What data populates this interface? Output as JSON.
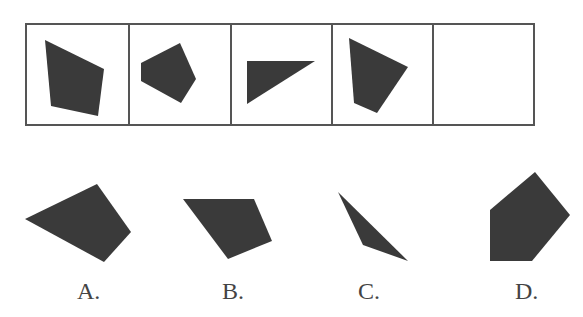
{
  "puzzle": {
    "colors": {
      "shape_fill": "#3a3a3a",
      "grid_border": "#555555",
      "background": "#ffffff",
      "label": "#444444"
    },
    "sequence": {
      "grid": {
        "x": 26,
        "y": 24,
        "width": 508,
        "height": 101,
        "dividers_x": [
          129,
          231,
          332,
          433
        ]
      },
      "cells": [
        {
          "index": 1,
          "shape": "quadrilateral",
          "points": "45,40 104,69 98,116 51,106"
        },
        {
          "index": 2,
          "shape": "pentagon",
          "points": "141,63 180,43 196,79 181,103 141,81"
        },
        {
          "index": 3,
          "shape": "triangle",
          "points": "247,61 315,61 247,104"
        },
        {
          "index": 4,
          "shape": "quadrilateral",
          "points": "349,38 408,67 377,113 354,103"
        },
        {
          "index": 5,
          "shape": "empty",
          "points": ""
        }
      ]
    },
    "options": [
      {
        "label": "A.",
        "shape": "quadrilateral",
        "points": "25,219 97,184 131,232 104,262",
        "label_x": 77,
        "label_y": 280
      },
      {
        "label": "B.",
        "shape": "quadrilateral",
        "points": "183,199 254,199 272,241 228,259",
        "label_x": 222,
        "label_y": 280
      },
      {
        "label": "C.",
        "shape": "triangle",
        "points": "338,192 408,261 363,245",
        "label_x": 358,
        "label_y": 280
      },
      {
        "label": "D.",
        "shape": "pentagon",
        "points": "490,210 535,172 570,215 532,261 490,261",
        "label_x": 515,
        "label_y": 280
      }
    ]
  }
}
